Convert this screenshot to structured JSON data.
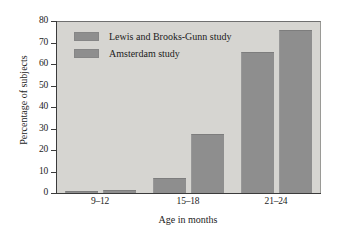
{
  "chart_data": {
    "type": "bar",
    "title": "",
    "subtitle": "",
    "xlabel": "Age in months",
    "ylabel": "Percentage of subjects",
    "categories": [
      "9–12",
      "15–18",
      "21–24"
    ],
    "series": [
      {
        "name": "Lewis and Brooks-Gunn study",
        "values": [
          1,
          7,
          65.5
        ]
      },
      {
        "name": "Amsterdam study",
        "values": [
          1.2,
          27.5,
          76
        ]
      }
    ],
    "ylim": [
      0,
      80
    ],
    "yticks": [
      0,
      10,
      20,
      30,
      40,
      50,
      60,
      70,
      80
    ],
    "ytick_labels": [
      "0",
      "10",
      "20",
      "30",
      "40",
      "50",
      "60",
      "70",
      "80"
    ],
    "grid": false,
    "legend_position": "top-left",
    "bar_color": "#8e8e8e",
    "plot_background": "#d6d5d1",
    "page_background": "#ffffff",
    "axis_color": "#3b3b3b"
  },
  "legend": {
    "items": [
      {
        "label": "Lewis and Brooks-Gunn study"
      },
      {
        "label": "Amsterdam study"
      }
    ]
  },
  "axes": {
    "y_title": "Percentage of subjects",
    "x_title": "Age in months",
    "y_labels": [
      "80",
      "70",
      "60",
      "50",
      "40",
      "30",
      "20",
      "10",
      "0"
    ],
    "x_labels": [
      "9–12",
      "15–18",
      "21–24"
    ]
  }
}
